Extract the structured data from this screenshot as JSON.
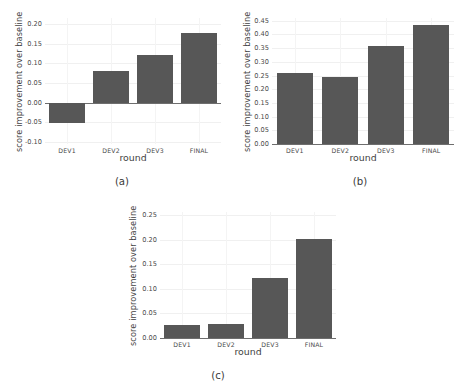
{
  "figure": {
    "background_color": "#ffffff",
    "bar_color": "#575757",
    "grid_color": "#f0f0f0",
    "axis_color": "#6e6e6e",
    "text_color": "#3f3f3f"
  },
  "panels": [
    {
      "caption": "(a)",
      "xlabel": "round",
      "ylabel": "score improvement over baseline",
      "yticks": [
        "0.20",
        "0.15",
        "0.10",
        "0.05",
        "0.00",
        "-0.05",
        "-0.10"
      ],
      "xticks": [
        "DEV1",
        "DEV2",
        "DEV3",
        "FINAL"
      ]
    },
    {
      "caption": "(b)",
      "xlabel": "round",
      "ylabel": "score improvement over baseline",
      "yticks": [
        "0.45",
        "0.40",
        "0.35",
        "0.30",
        "0.25",
        "0.20",
        "0.15",
        "0.10",
        "0.05",
        "0.00"
      ],
      "xticks": [
        "DEV1",
        "DEV2",
        "DEV3",
        "FINAL"
      ]
    },
    {
      "caption": "(c)",
      "xlabel": "round",
      "ylabel": "score improvement over baseline",
      "yticks": [
        "0.25",
        "0.20",
        "0.15",
        "0.10",
        "0.05",
        "0.00"
      ],
      "xticks": [
        "DEV1",
        "DEV2",
        "DEV3",
        "FINAL"
      ]
    }
  ],
  "chart_data": [
    {
      "type": "bar",
      "panel": "(a)",
      "title": "",
      "xlabel": "round",
      "ylabel": "score improvement over baseline",
      "categories": [
        "DEV1",
        "DEV2",
        "DEV3",
        "FINAL"
      ],
      "values": [
        -0.051,
        0.08,
        0.121,
        0.178
      ],
      "ylim": [
        -0.105,
        0.215
      ],
      "ytick_values": [
        0.2,
        0.15,
        0.1,
        0.05,
        0.0,
        -0.05,
        -0.1
      ],
      "grid": true,
      "legend": "none",
      "bar_color": "#575757"
    },
    {
      "type": "bar",
      "panel": "(b)",
      "title": "",
      "xlabel": "round",
      "ylabel": "score improvement over baseline",
      "categories": [
        "DEV1",
        "DEV2",
        "DEV3",
        "FINAL"
      ],
      "values": [
        0.259,
        0.246,
        0.357,
        0.436
      ],
      "ylim": [
        0.0,
        0.46
      ],
      "ytick_values": [
        0.45,
        0.4,
        0.35,
        0.3,
        0.25,
        0.2,
        0.15,
        0.1,
        0.05,
        0.0
      ],
      "grid": true,
      "legend": "none",
      "bar_color": "#575757"
    },
    {
      "type": "bar",
      "panel": "(c)",
      "title": "",
      "xlabel": "round",
      "ylabel": "score improvement over baseline",
      "categories": [
        "DEV1",
        "DEV2",
        "DEV3",
        "FINAL"
      ],
      "values": [
        0.026,
        0.028,
        0.121,
        0.202
      ],
      "ylim": [
        0.0,
        0.256
      ],
      "ytick_values": [
        0.25,
        0.2,
        0.15,
        0.1,
        0.05,
        0.0
      ],
      "grid": true,
      "legend": "none",
      "bar_color": "#575757"
    }
  ]
}
